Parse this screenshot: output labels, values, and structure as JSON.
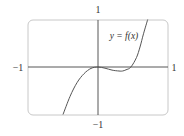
{
  "chart_data": {
    "type": "line",
    "title": "",
    "function_label": "y = f(x)",
    "xlabel": "",
    "ylabel": "",
    "xlim": [
      -1,
      1
    ],
    "ylim": [
      -1,
      1
    ],
    "x_tick_labels": {
      "left": "−1",
      "right": "1"
    },
    "y_tick_labels": {
      "top": "1",
      "bottom": "−1"
    },
    "grid": false,
    "series": [
      {
        "name": "f(x)",
        "x": [
          -0.5,
          -0.4,
          -0.3,
          -0.2,
          -0.1,
          0.0,
          0.1,
          0.2,
          0.3,
          0.35,
          0.4,
          0.47,
          0.55,
          0.6,
          0.65,
          0.71
        ],
        "y": [
          -1.0,
          -0.62,
          -0.33,
          -0.14,
          -0.03,
          0.0,
          -0.025,
          -0.065,
          -0.085,
          -0.085,
          -0.06,
          0.0,
          0.2,
          0.42,
          0.7,
          1.0
        ]
      }
    ],
    "features": {
      "local_max": [
        0.0,
        0.0
      ],
      "local_min": [
        0.34,
        -0.085
      ],
      "zeros": [
        0.0,
        0.47
      ]
    }
  },
  "labels": {
    "function": "y = f(x)",
    "x_min": "−1",
    "x_max": "1",
    "y_max": "1",
    "y_min": "−1"
  }
}
